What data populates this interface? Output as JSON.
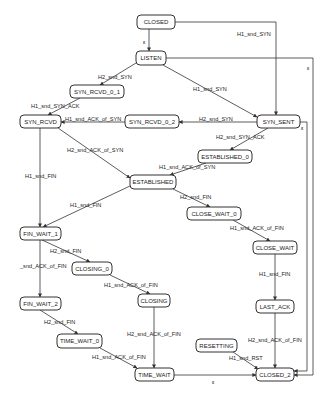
{
  "diagram": {
    "type": "state-machine",
    "nodes": [
      {
        "id": "CLOSED",
        "label": "CLOSED",
        "x": 137,
        "y": 15,
        "w": 38,
        "h": 14
      },
      {
        "id": "LISTEN",
        "label": "LISTEN",
        "x": 136,
        "y": 51,
        "w": 30,
        "h": 14
      },
      {
        "id": "SYN_RCVD_0_1",
        "label": "SYN_RCVD_0_1",
        "x": 70,
        "y": 85,
        "w": 54,
        "h": 13
      },
      {
        "id": "SYN_RCVD",
        "label": "SYN_RCVD",
        "x": 20,
        "y": 115,
        "w": 41,
        "h": 13
      },
      {
        "id": "SYN_RCVD_0_2",
        "label": "SYN_RCVD_0_2",
        "x": 125,
        "y": 115,
        "w": 54,
        "h": 13
      },
      {
        "id": "SYN_SENT",
        "label": "SYN_SENT",
        "x": 257,
        "y": 115,
        "w": 43,
        "h": 13
      },
      {
        "id": "ESTABLISHED_0",
        "label": "ESTABLISHED_0",
        "x": 198,
        "y": 150,
        "w": 54,
        "h": 13
      },
      {
        "id": "ESTABLISHED",
        "label": "ESTABLISHED",
        "x": 130,
        "y": 175,
        "w": 46,
        "h": 14
      },
      {
        "id": "FIN_WAIT_1",
        "label": "FIN_WAIT_1",
        "x": 20,
        "y": 227,
        "w": 41,
        "h": 13
      },
      {
        "id": "CLOSE_WAIT_0",
        "label": "CLOSE_WAIT_0",
        "x": 187,
        "y": 207,
        "w": 54,
        "h": 13
      },
      {
        "id": "CLOSE_WAIT",
        "label": "CLOSE_WAIT",
        "x": 253,
        "y": 241,
        "w": 44,
        "h": 13
      },
      {
        "id": "CLOSING_0",
        "label": "CLOSING_0",
        "x": 72,
        "y": 262,
        "w": 40,
        "h": 13
      },
      {
        "id": "FIN_WAIT_2",
        "label": "FIN_WAIT_2",
        "x": 20,
        "y": 297,
        "w": 41,
        "h": 13
      },
      {
        "id": "CLOSING",
        "label": "CLOSING",
        "x": 138,
        "y": 294,
        "w": 32,
        "h": 13
      },
      {
        "id": "LAST_ACK",
        "label": "LAST_ACK",
        "x": 256,
        "y": 300,
        "w": 38,
        "h": 13
      },
      {
        "id": "TIME_WAIT_0",
        "label": "TIME_WAIT_0",
        "x": 57,
        "y": 334,
        "w": 45,
        "h": 14
      },
      {
        "id": "RESETTING",
        "label": "RESETTING",
        "x": 196,
        "y": 339,
        "w": 41,
        "h": 13
      },
      {
        "id": "TIME_WAIT",
        "label": "TIME_WAIT",
        "x": 135,
        "y": 368,
        "w": 39,
        "h": 13
      },
      {
        "id": "CLOSED_2",
        "label": "CLOSED_2",
        "x": 256,
        "y": 368,
        "w": 38,
        "h": 13
      }
    ],
    "edges": [
      {
        "from": "CLOSED",
        "to": "LISTEN",
        "label": "ε"
      },
      {
        "from": "CLOSED",
        "to": "SYN_SENT",
        "label": "H1_snd_SYN"
      },
      {
        "from": "LISTEN",
        "to": "SYN_RCVD_0_1",
        "label": "H2_snd_SYN"
      },
      {
        "from": "LISTEN",
        "to": "SYN_SENT",
        "label": "H1_snd_SYN"
      },
      {
        "from": "LISTEN",
        "to": "CLOSED_2",
        "label": "ε"
      },
      {
        "from": "SYN_RCVD_0_1",
        "to": "SYN_RCVD",
        "label": "H1_snd_SYN_ACK"
      },
      {
        "from": "SYN_RCVD_0_2",
        "to": "SYN_RCVD",
        "label": "H1_snd_ACK_of_SYN"
      },
      {
        "from": "SYN_SENT",
        "to": "SYN_RCVD_0_2",
        "label": "H2_snd_SYN"
      },
      {
        "from": "SYN_SENT",
        "to": "ESTABLISHED_0",
        "label": "H2_snd_SYN_ACK"
      },
      {
        "from": "SYN_SENT",
        "to": "CLOSED_2",
        "label": "ε"
      },
      {
        "from": "SYN_RCVD",
        "to": "ESTABLISHED",
        "label": "H2_snd_ACK_of_SYN"
      },
      {
        "from": "SYN_RCVD",
        "to": "FIN_WAIT_1",
        "label": "H1_snd_FIN"
      },
      {
        "from": "ESTABLISHED_0",
        "to": "ESTABLISHED",
        "label": "H1_snd_ACK_of_SYN"
      },
      {
        "from": "ESTABLISHED",
        "to": "FIN_WAIT_1",
        "label": "H1_snd_FIN"
      },
      {
        "from": "ESTABLISHED",
        "to": "CLOSE_WAIT_0",
        "label": "H2_snd_FIN"
      },
      {
        "from": "CLOSE_WAIT_0",
        "to": "CLOSE_WAIT",
        "label": "H1_snd_ACK_of_FIN"
      },
      {
        "from": "CLOSE_WAIT",
        "to": "LAST_ACK",
        "label": "H1_snd_FIN"
      },
      {
        "from": "FIN_WAIT_1",
        "to": "CLOSING_0",
        "label": "H2_snd_FIN"
      },
      {
        "from": "FIN_WAIT_1",
        "to": "FIN_WAIT_2",
        "label": "_snd_ACK_of_FIN"
      },
      {
        "from": "CLOSING_0",
        "to": "CLOSING",
        "label": "H1_snd_ACK_of_FIN"
      },
      {
        "from": "FIN_WAIT_2",
        "to": "TIME_WAIT_0",
        "label": "H2_snd_FIN"
      },
      {
        "from": "CLOSING",
        "to": "TIME_WAIT",
        "label": "H2_snd_ACK_of_FIN"
      },
      {
        "from": "TIME_WAIT_0",
        "to": "TIME_WAIT",
        "label": "H1_snd_ACK_of_FIN"
      },
      {
        "from": "LAST_ACK",
        "to": "CLOSED_2",
        "label": "H2_snd_ACK_of_FIN"
      },
      {
        "from": "RESETTING",
        "to": "CLOSED_2",
        "label": "H1_snd_RST"
      },
      {
        "from": "TIME_WAIT",
        "to": "CLOSED_2",
        "label": "ε"
      }
    ]
  },
  "labels": {
    "closed": "CLOSED",
    "listen": "LISTEN",
    "syn_rcvd_0_1": "SYN_RCVD_0_1",
    "syn_rcvd": "SYN_RCVD",
    "syn_rcvd_0_2": "SYN_RCVD_0_2",
    "syn_sent": "SYN_SENT",
    "established_0": "ESTABLISHED_0",
    "established": "ESTABLISHED",
    "fin_wait_1": "FIN_WAIT_1",
    "close_wait_0": "CLOSE_WAIT_0",
    "close_wait": "CLOSE_WAIT",
    "closing_0": "CLOSING_0",
    "fin_wait_2": "FIN_WAIT_2",
    "closing": "CLOSING",
    "last_ack": "LAST_ACK",
    "time_wait_0": "TIME_WAIT_0",
    "resetting": "RESETTING",
    "time_wait": "TIME_WAIT",
    "closed_2": "CLOSED_2"
  },
  "edge_labels": {
    "closed_listen": "ε",
    "closed_synsent": "H1_snd_SYN",
    "listen_synrcvd01": "H2_snd_SYN",
    "listen_synsent": "H1_snd_SYN",
    "listen_closed2": "ε",
    "synrcvd01_synrcvd": "H1_snd_SYN_ACK",
    "synrcvd02_synrcvd": "H1_snd_ACK_of_SYN",
    "synsent_synrcvd02": "H2_snd_SYN",
    "synsent_est0": "H2_snd_SYN_ACK",
    "synsent_closed2": "ε",
    "synrcvd_est": "H2_snd_ACK_of_SYN",
    "synrcvd_finwait1": "H1_snd_FIN",
    "est0_est": "H1_snd_ACK_of_SYN",
    "est_finwait1": "H1_snd_FIN",
    "est_closewait0": "H2_snd_FIN",
    "closewait0_closewait": "H1_snd_ACK_of_FIN",
    "closewait_lastack": "H1_snd_FIN",
    "finwait1_closing0": "H2_snd_FIN",
    "finwait1_finwait2": "_snd_ACK_of_FIN",
    "closing0_closing": "H1_snd_ACK_of_FIN",
    "finwait2_timewait0": "H2_snd_FIN",
    "closing_timewait": "H2_snd_ACK_of_FIN",
    "timewait0_timewait": "H1_snd_ACK_of_FIN",
    "lastack_closed2": "H2_snd_ACK_of_FIN",
    "resetting_closed2": "H1_snd_RST",
    "timewait_closed2": "ε"
  }
}
